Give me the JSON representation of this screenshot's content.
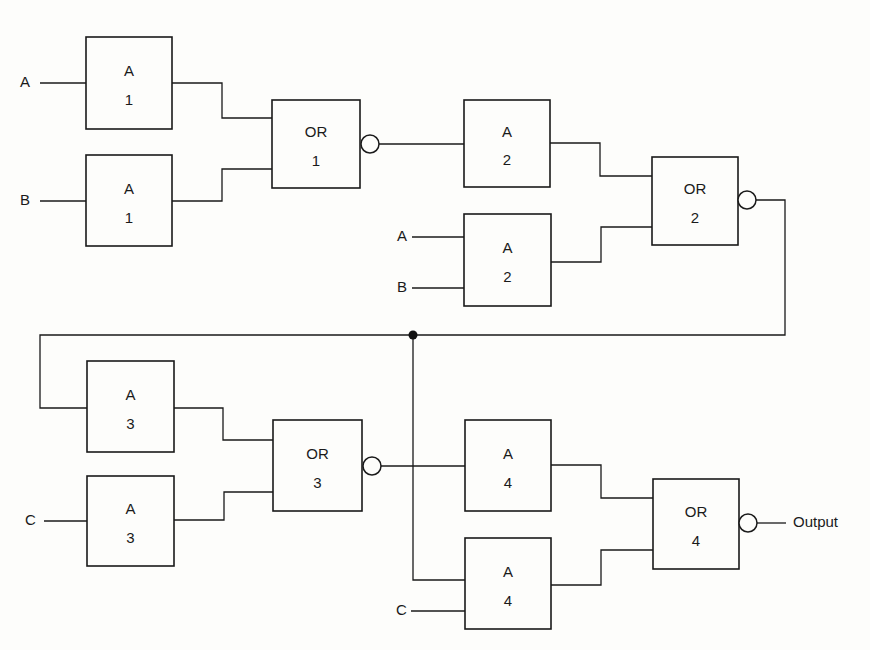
{
  "diagram": {
    "title": "",
    "colors": {
      "line": "#1a1a1a",
      "background": "#fdfdfb"
    },
    "gates": [
      {
        "id": "and-1a",
        "type": "A",
        "number": "1",
        "x": 86,
        "y": 37,
        "w": 86,
        "h": 92
      },
      {
        "id": "and-1b",
        "type": "A",
        "number": "1",
        "x": 86,
        "y": 155,
        "w": 86,
        "h": 91
      },
      {
        "id": "or-1",
        "type": "OR",
        "number": "1",
        "x": 272,
        "y": 100,
        "w": 88,
        "h": 88,
        "inverted": true
      },
      {
        "id": "and-2a",
        "type": "A",
        "number": "2",
        "x": 464,
        "y": 100,
        "w": 86,
        "h": 87
      },
      {
        "id": "and-2b",
        "type": "A",
        "number": "2",
        "x": 464,
        "y": 214,
        "w": 87,
        "h": 92
      },
      {
        "id": "or-2",
        "type": "OR",
        "number": "2",
        "x": 652,
        "y": 157,
        "w": 86,
        "h": 88,
        "inverted": true
      },
      {
        "id": "and-3a",
        "type": "A",
        "number": "3",
        "x": 87,
        "y": 361,
        "w": 87,
        "h": 91
      },
      {
        "id": "and-3b",
        "type": "A",
        "number": "3",
        "x": 87,
        "y": 476,
        "w": 87,
        "h": 90
      },
      {
        "id": "or-3",
        "type": "OR",
        "number": "3",
        "x": 273,
        "y": 420,
        "w": 89,
        "h": 91,
        "inverted": true
      },
      {
        "id": "and-4a",
        "type": "A",
        "number": "4",
        "x": 465,
        "y": 420,
        "w": 86,
        "h": 91
      },
      {
        "id": "and-4b",
        "type": "A",
        "number": "4",
        "x": 465,
        "y": 538,
        "w": 86,
        "h": 91
      },
      {
        "id": "or-4",
        "type": "OR",
        "number": "4",
        "x": 653,
        "y": 479,
        "w": 86,
        "h": 90,
        "inverted": true
      }
    ],
    "inputs": [
      {
        "id": "input-a-1",
        "label": "A",
        "x": 20,
        "y": 83
      },
      {
        "id": "input-b-1",
        "label": "B",
        "x": 20,
        "y": 201
      },
      {
        "id": "input-a-2",
        "label": "A",
        "x": 397,
        "y": 237
      },
      {
        "id": "input-b-2",
        "label": "B",
        "x": 397,
        "y": 288
      },
      {
        "id": "input-c-1",
        "label": "C",
        "x": 25,
        "y": 521
      },
      {
        "id": "input-c-2",
        "label": "C",
        "x": 396,
        "y": 611
      }
    ],
    "output": {
      "label": "Output",
      "x": 793,
      "y": 523
    },
    "bubbles": [
      {
        "gate": "or-1",
        "cx": 370,
        "cy": 144
      },
      {
        "gate": "or-2",
        "cx": 747,
        "cy": 200
      },
      {
        "gate": "or-3",
        "cx": 372,
        "cy": 466
      },
      {
        "gate": "or-4",
        "cx": 748,
        "cy": 523
      }
    ],
    "junctions": [
      {
        "cx": 413,
        "cy": 335
      }
    ],
    "wires": [
      "M40 83 H86",
      "M40 201 H86",
      "M172 83 H222 V118 H272",
      "M172 201 H222 V169 H272",
      "M379 144 H464",
      "M412 237 H464",
      "M412 288 H464",
      "M550 143 H600 V176 H652",
      "M551 262 H601 V227 H652",
      "M756 200 H785 V335 H40 V408 H87",
      "M44 521 H87",
      "M174 408 H223 V440 H273",
      "M174 520 H224 V492 H273",
      "M381 466 H465",
      "M413 335 V580 H465",
      "M411 611 H465",
      "M551 465 H601 V498 H653",
      "M551 585 H601 V550 H653",
      "M757 523 H786"
    ]
  }
}
